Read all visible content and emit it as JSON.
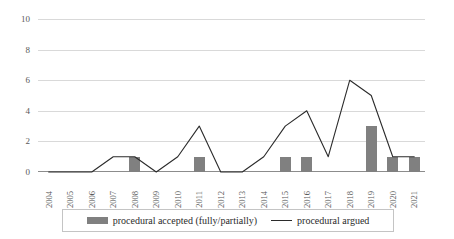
{
  "chart_data": {
    "type": "bar",
    "title": "",
    "subtitle": "",
    "xlabel": "",
    "ylabel": "",
    "ylim": [
      0,
      10
    ],
    "yticks": [
      0,
      2,
      4,
      6,
      8,
      10
    ],
    "grid": true,
    "legend_position": "bottom",
    "categories": [
      "2004",
      "2005",
      "2006",
      "2007",
      "2008",
      "2009",
      "2010",
      "2011",
      "2012",
      "2013",
      "2014",
      "2015",
      "2016",
      "2017",
      "2018",
      "2019",
      "2020",
      "2021"
    ],
    "series": [
      {
        "name": "procedural accepted (fully/partially)",
        "type": "bar",
        "color": "#808080",
        "values": [
          0,
          0,
          0,
          0,
          1,
          0,
          0,
          1,
          0,
          0,
          0,
          1,
          1,
          0,
          0,
          3,
          1,
          1
        ]
      },
      {
        "name": "procedural argued",
        "type": "line",
        "color": "#2b2b2b",
        "values": [
          0,
          0,
          0,
          1,
          1,
          0,
          1,
          3,
          0,
          0,
          1,
          3,
          4,
          1,
          6,
          5,
          1,
          1
        ]
      }
    ]
  },
  "legend": {
    "entries": [
      {
        "label": "procedural accepted (fully/partially)",
        "swatch": "bar-swatch-icon"
      },
      {
        "label": "procedural argued",
        "swatch": "line-swatch-icon"
      }
    ]
  }
}
